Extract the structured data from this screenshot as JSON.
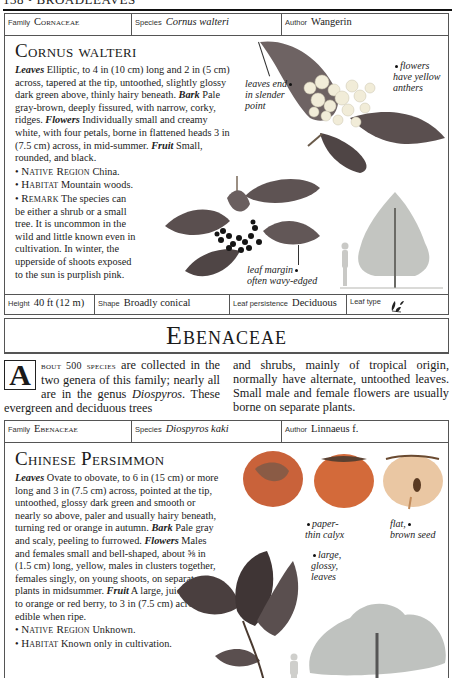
{
  "page": {
    "running_head": "138 • BROADLEAVES"
  },
  "entries": [
    {
      "meta": {
        "family_label": "Family",
        "family": "Cornaceae",
        "species_label": "Species",
        "species": "Cornus walteri",
        "author_label": "Author",
        "author": "Wangerin"
      },
      "title": "Cornus walteri",
      "description": {
        "leaves_key": "Leaves",
        "leaves": " Elliptic, to 4 in (10 cm) long and 2 in (5 cm) across, tapered at the tip, untoothed, slightly glossy dark green above, thinly hairy beneath. ",
        "bark_key": "Bark",
        "bark": " Pale gray-brown, deeply fissured, with narrow, corky, ridges. ",
        "flowers_key": "Flowers",
        "flowers": " Individually small and creamy white, with four petals, borne in flattened heads 3 in (7.5 cm) across, in mid-summer. ",
        "fruit_key": "Fruit",
        "fruit": " Small, rounded, and black."
      },
      "bullets": [
        {
          "key": "Native Region",
          "value": " China."
        },
        {
          "key": "Habitat",
          "value": " Mountain woods."
        },
        {
          "key": "Remark",
          "value": " The species can be either a shrub or a small tree. It is uncommon in the wild and little known even in cultivation. In winter, the upperside of shoots exposed to the sun is purplish pink."
        }
      ],
      "captions": {
        "leaves_end": [
          "leaves end",
          "in slender",
          "point"
        ],
        "flowers": [
          "flowers",
          "have yellow",
          "anthers"
        ],
        "leaf_margin": [
          "leaf margin",
          "often wavy-edged"
        ]
      },
      "stats": {
        "height_label": "Height",
        "height": "40 ft (12 m)",
        "shape_label": "Shape",
        "shape": "Broadly conical",
        "persistence_label": "Leaf persistence",
        "persistence": "Deciduous",
        "leaftype_label": "Leaf type",
        "leaftype_icon": "simple-leaf-icon"
      }
    },
    {
      "meta": {
        "family_label": "Family",
        "family": "Ebenaceae",
        "species_label": "Species",
        "species": "Diospyros kaki",
        "author_label": "Author",
        "author": "Linnaeus f."
      },
      "title": "Chinese Persimmon",
      "description": {
        "leaves_key": "Leaves",
        "leaves": " Ovate to obovate, to 6 in (15 cm) or more long and 3 in (7.5 cm) across, pointed at the tip, untoothed, glossy dark green and smooth or nearly so above, paler and usually hairy beneath, turning red or orange in autumn. ",
        "bark_key": "Bark",
        "bark": " Pale gray and scaly, peeling to furrowed. ",
        "flowers_key": "Flowers",
        "flowers": " Males and females small and bell-shaped, about ⅝ in (1.5 cm) long, yellow, males in clusters together, females singly, on young shoots, on separate plants in midsummer. ",
        "fruit_key": "Fruit",
        "fruit": " A large, juicy, yellow to orange or red berry, to 3 in (7.5 cm) across, edible when ripe."
      },
      "bullets": [
        {
          "key": "Native Region",
          "value": " Unknown."
        },
        {
          "key": "Habitat",
          "value": " Known only in cultivation."
        }
      ],
      "captions": {
        "calyx": [
          "paper-",
          "thin calyx"
        ],
        "seed": [
          "flat,",
          "brown seed"
        ],
        "leaves": [
          "large,",
          "glossy,",
          "leaves"
        ]
      }
    }
  ],
  "family_section": {
    "title": "Ebenaceae",
    "dropcap": "A",
    "lead": "bout 500 species",
    "text_1": " are collected in the two genera of this family; nearly all are in the genus ",
    "genus": "Diospyros",
    "text_2": ". These evergreen and deciduous trees",
    "text_3": "and shrubs, mainly of tropical origin, normally have alternate, untoothed leaves. Small male and female flowers are usually borne on separate plants."
  },
  "colors": {
    "leaf_dark": "#4a3f3f",
    "leaf_mid": "#6e6363",
    "flower_cream": "#f1ecd8",
    "berry_black": "#151515",
    "persimmon_orange": "#d36a3a",
    "persimmon_light": "#eac7a3",
    "tree_gray": "#8a8f8a"
  }
}
